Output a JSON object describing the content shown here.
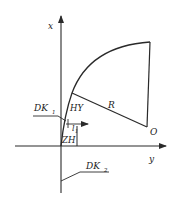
{
  "diagram": {
    "type": "spiral-curve-coordinate-sketch",
    "colors": {
      "stroke": "#2a2a2a",
      "background": "#ffffff",
      "text": "#222222"
    },
    "axes": {
      "vertical_label": "x",
      "horizontal_label": "y"
    },
    "points": {
      "zh": "ZH",
      "hy": "HY",
      "center": "O"
    },
    "labels": {
      "radius": "R",
      "dk1_main": "DK",
      "dk1_sub": "1",
      "dk2_main": "DK",
      "dk2_sub": "2",
      "l1_main": "l",
      "l1_sub": "1"
    }
  }
}
